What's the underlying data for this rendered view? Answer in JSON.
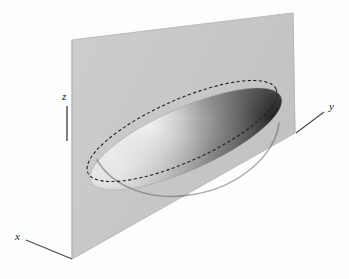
{
  "figure": {
    "background_color": "#fdfdfd"
  },
  "axes": {
    "x": {
      "label": "x",
      "label_x": 16,
      "label_y": 240,
      "line": "M 26 240 L 72 259"
    },
    "y": {
      "label": "y",
      "label_x": 329,
      "label_y": 110,
      "line": "M 296 133 L 324 112"
    },
    "z": {
      "label": "z",
      "label_x": 62,
      "label_y": 100,
      "line": "M 67 106 L 67 141"
    }
  },
  "plane": {
    "name": "cutting-plane",
    "fill_color": "#c9c9c9",
    "edge_color": "#b4b4b4",
    "points": "72,40 293,13 295,133 72,259"
  },
  "ellipsoid": {
    "name": "ellipsoid-body",
    "highlight_color": "#f4f4f4",
    "midtone_color": "#cfcfcf",
    "shadow_color": "#2e2e2e",
    "center_x": 186,
    "center_y": 139,
    "radius_x": 104,
    "radius_y": 31,
    "rotation_deg": -24
  },
  "intersection_curve": {
    "name": "intersection-ellipse",
    "style": "dashed",
    "stroke_color": "#23232b",
    "stroke_width": 1.1,
    "dash_pattern": "3.2 2.4",
    "center_x": 182,
    "center_y": 131,
    "radius_x": 103,
    "radius_y": 31,
    "rotation_deg": -24
  },
  "colors": {
    "background": "#fdfdfd",
    "plane_gray": "#c9c9c9",
    "ink": "#1c1c1c",
    "shadow": "#2e2e2e",
    "highlight": "#f6f6f6"
  }
}
